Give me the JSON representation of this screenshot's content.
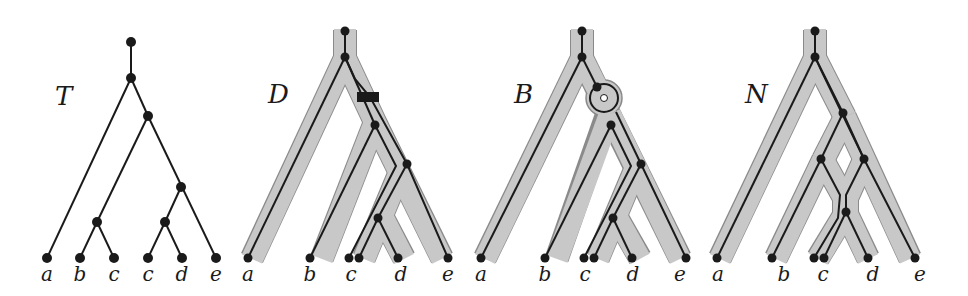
{
  "colors": {
    "edge": "#1a1a1a",
    "tube": "#c8c8c8",
    "tube_outline": "#8a8a8a",
    "node": "#1a1a1a",
    "background": "#ffffff"
  },
  "panels": [
    {
      "id": "T",
      "title": "T",
      "description": "species tree",
      "leaves": [
        "a",
        "b",
        "c",
        "c",
        "d",
        "e"
      ]
    },
    {
      "id": "D",
      "title": "D",
      "description": "gene tree embedded in species tree with duplication event (black rectangle)",
      "leaves": [
        "a",
        "b",
        "c",
        "d",
        "e"
      ]
    },
    {
      "id": "B",
      "title": "B",
      "description": "gene tree embedded with loop/bubble event (circle)",
      "leaves": [
        "a",
        "b",
        "c",
        "d",
        "e"
      ]
    },
    {
      "id": "N",
      "title": "N",
      "description": "gene tree embedded in network with reticulation (diamond)",
      "leaves": [
        "a",
        "b",
        "c",
        "d",
        "e"
      ]
    }
  ]
}
